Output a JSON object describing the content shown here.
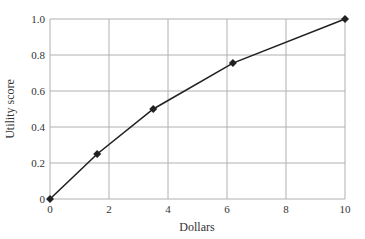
{
  "chart_data": {
    "type": "line",
    "title": "",
    "xlabel": "Dollars",
    "ylabel": "Utility score",
    "xlim": [
      0,
      10
    ],
    "ylim": [
      0,
      1.0
    ],
    "x_ticks": [
      "0",
      "2",
      "4",
      "6",
      "8",
      "10"
    ],
    "y_ticks": [
      "0",
      "0.2",
      "0.4",
      "0.6",
      "0.8",
      "1.0"
    ],
    "grid": true,
    "legend": null,
    "marker": "diamond",
    "series": [
      {
        "name": "Utility curve",
        "x": [
          0,
          1.6,
          3.5,
          6.2,
          10
        ],
        "y": [
          0,
          0.25,
          0.5,
          0.755,
          1.0
        ]
      }
    ]
  },
  "colors": {
    "line": "#222222",
    "grid": "#b0b0b0",
    "text": "#333333"
  }
}
